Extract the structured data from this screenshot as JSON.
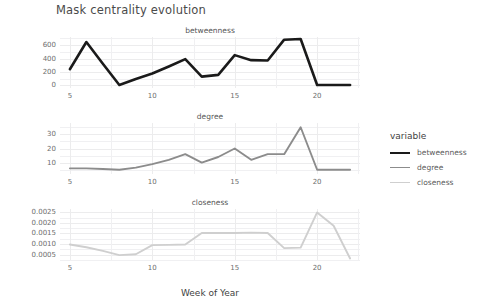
{
  "chart_title": "Mask centrality evolution",
  "axis": {
    "xlabel": "Week of Year"
  },
  "legend": {
    "title": "variable",
    "entries": [
      {
        "label": "betweenness",
        "color": "#1a1a1a",
        "width": 2.6
      },
      {
        "label": "degree",
        "color": "#8c8c8c",
        "width": 1.9
      },
      {
        "label": "closeness",
        "color": "#cfcfcf",
        "width": 1.9
      }
    ]
  },
  "panels": [
    {
      "strip": "betweenness",
      "yticks": [
        "0",
        "200",
        "400",
        "600"
      ]
    },
    {
      "strip": "degree",
      "yticks": [
        "10",
        "20",
        "30"
      ]
    },
    {
      "strip": "closeness",
      "yticks": [
        "0.0005",
        "0.0010",
        "0.0015",
        "0.0020",
        "0.0025"
      ]
    }
  ],
  "xticks": [
    "5",
    "10",
    "15",
    "20"
  ],
  "chart_data": {
    "type": "line",
    "title": "Mask centrality evolution",
    "xlabel": "Week of Year",
    "ylabel": "",
    "grid": true,
    "legend_position": "right",
    "legend_title": "variable",
    "facet": "variable",
    "x": [
      5,
      6,
      7,
      8,
      9,
      10,
      11,
      12,
      13,
      14,
      15,
      16,
      17,
      18,
      19,
      20,
      21,
      22
    ],
    "xlim": [
      4.4,
      22.6
    ],
    "xticks": [
      5,
      10,
      15,
      20
    ],
    "panels": [
      {
        "name": "betweenness",
        "color": "#1a1a1a",
        "ylim": [
          -40,
          720
        ],
        "yticks": [
          0,
          200,
          400,
          600
        ],
        "values": [
          240,
          645,
          320,
          5,
          95,
          175,
          280,
          390,
          130,
          155,
          450,
          375,
          370,
          680,
          690,
          5,
          5,
          5
        ]
      },
      {
        "name": "degree",
        "color": "#8c8c8c",
        "ylim": [
          2,
          38
        ],
        "yticks": [
          10,
          20,
          30
        ],
        "values": [
          6,
          6,
          5.5,
          5,
          6.5,
          9,
          12,
          16,
          10,
          14,
          20,
          12,
          16,
          16,
          35,
          5,
          5,
          5
        ]
      },
      {
        "name": "closeness",
        "color": "#cfcfcf",
        "ylim": [
          0.00025,
          0.00265
        ],
        "yticks": [
          0.0005,
          0.001,
          0.0015,
          0.002,
          0.0025
        ],
        "values": [
          0.00098,
          0.00085,
          0.00068,
          0.00048,
          0.00052,
          0.00095,
          0.00096,
          0.00098,
          0.00152,
          0.00152,
          0.00152,
          0.00154,
          0.00152,
          0.00081,
          0.00083,
          0.00249,
          0.00186,
          0.00032
        ]
      }
    ]
  }
}
